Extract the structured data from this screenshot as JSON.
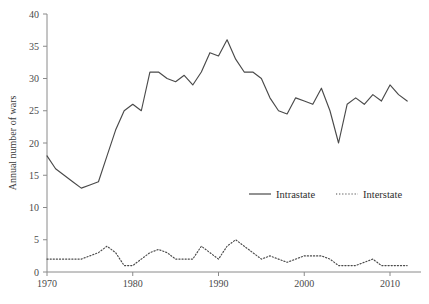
{
  "chart_data": {
    "type": "line",
    "title": "",
    "xlabel": "",
    "ylabel": "Annual number of wars",
    "xlim": [
      1970,
      2012
    ],
    "ylim": [
      0,
      40
    ],
    "xticks": [
      1970,
      1980,
      1990,
      2000,
      2010
    ],
    "yticks": [
      0,
      5,
      10,
      15,
      20,
      25,
      30,
      35,
      40
    ],
    "grid": false,
    "legend_position": "center-right",
    "series": [
      {
        "name": "Intrastate",
        "style": "solid",
        "color": "#4a4a4a",
        "x": [
          1970,
          1971,
          1972,
          1973,
          1974,
          1975,
          1976,
          1977,
          1978,
          1979,
          1980,
          1981,
          1982,
          1983,
          1984,
          1985,
          1986,
          1987,
          1988,
          1989,
          1990,
          1991,
          1992,
          1993,
          1994,
          1995,
          1996,
          1997,
          1998,
          1999,
          2000,
          2001,
          2002,
          2003,
          2004,
          2005,
          2006,
          2007,
          2008,
          2009,
          2010,
          2011,
          2012
        ],
        "values": [
          18,
          16,
          15,
          14,
          13,
          13.5,
          14,
          18,
          22,
          25,
          26,
          25,
          31,
          31,
          30,
          29.5,
          30.5,
          29,
          31,
          34,
          33.5,
          36,
          33,
          31,
          31,
          30,
          27,
          25,
          24.5,
          27,
          26.5,
          26,
          28.5,
          25,
          20,
          26,
          27,
          26,
          27.5,
          26.5,
          29,
          27.5,
          26.5
        ]
      },
      {
        "name": "Interstate",
        "style": "dotted",
        "color": "#4a4a4a",
        "x": [
          1970,
          1971,
          1972,
          1973,
          1974,
          1975,
          1976,
          1977,
          1978,
          1979,
          1980,
          1981,
          1982,
          1983,
          1984,
          1985,
          1986,
          1987,
          1988,
          1989,
          1990,
          1991,
          1992,
          1993,
          1994,
          1995,
          1996,
          1997,
          1998,
          1999,
          2000,
          2001,
          2002,
          2003,
          2004,
          2005,
          2006,
          2007,
          2008,
          2009,
          2010,
          2011,
          2012
        ],
        "values": [
          2,
          2,
          2,
          2,
          2,
          2.5,
          3,
          4,
          3,
          1,
          1,
          2,
          3,
          3.5,
          3,
          2,
          2,
          2,
          4,
          3,
          2,
          4,
          5,
          4,
          3,
          2,
          2.5,
          2,
          1.5,
          2,
          2.5,
          2.5,
          2.5,
          2,
          1,
          1,
          1,
          1.5,
          2,
          1,
          1,
          1,
          1
        ]
      }
    ],
    "legend": [
      {
        "label": "Intrastate",
        "style": "solid"
      },
      {
        "label": "Interstate",
        "style": "dotted"
      }
    ]
  },
  "caption": ""
}
